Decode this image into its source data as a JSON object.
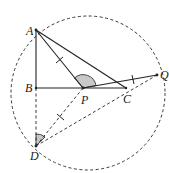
{
  "diagram": {
    "type": "geometry",
    "points": {
      "A": {
        "label": "A",
        "x": 36,
        "y": 30
      },
      "B": {
        "label": "B",
        "x": 36,
        "y": 88
      },
      "P": {
        "label": "P",
        "x": 83,
        "y": 88
      },
      "C": {
        "label": "C",
        "x": 126,
        "y": 88
      },
      "Q": {
        "label": "Q",
        "x": 157,
        "y": 75
      },
      "D": {
        "label": "D",
        "x": 36,
        "y": 146
      }
    },
    "circle": {
      "cx": 88,
      "cy": 93,
      "r": 77,
      "style": "dashed"
    },
    "solid_segments": [
      "AB",
      "AC",
      "AP",
      "BC",
      "PQ"
    ],
    "dashed_segments": [
      "BD",
      "PD",
      "DQ",
      "CQ"
    ],
    "tick_marks": [
      "AP",
      "PD",
      "CQ"
    ],
    "shaded_angles": [
      "APQ",
      "BDP"
    ],
    "colors": {
      "stroke": "#222222",
      "shade": "#c8c8c8"
    }
  }
}
